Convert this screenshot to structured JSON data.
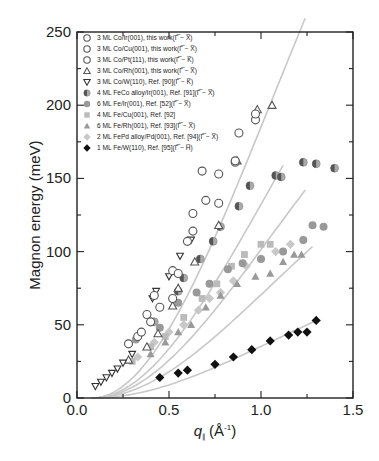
{
  "chart_data": {
    "type": "scatter",
    "title": "",
    "xlabel": "q∥ (Å⁻¹)",
    "xlabel_main": "q",
    "xlabel_sub": "∥",
    "xlabel_unit": "(Å",
    "xlabel_unit_sup": "-1",
    "xlabel_unit_close": ")",
    "ylabel": "Magnon energy (meV)",
    "xlim": [
      0.0,
      1.5
    ],
    "ylim": [
      0,
      250
    ],
    "xticks": [
      0.0,
      0.5,
      1.0,
      1.5
    ],
    "xtick_labels": [
      "0.0",
      "0.5",
      "1.0",
      "1.5"
    ],
    "yticks": [
      0,
      50,
      100,
      150,
      200,
      250
    ],
    "ytick_labels": [
      "0",
      "50",
      "100",
      "150",
      "200",
      "250"
    ],
    "grid": false,
    "legend_position": "upper left",
    "series": [
      {
        "name": "3 ML Co/Ir(001), this work",
        "direction": "(Γ̅ − X̅)",
        "marker": "circle-open",
        "color": "#555555",
        "points": [
          [
            0.28,
            37
          ],
          [
            0.33,
            42
          ],
          [
            0.38,
            57
          ],
          [
            0.42,
            70
          ],
          [
            0.52,
            87
          ],
          [
            0.6,
            107
          ],
          [
            0.68,
            155
          ],
          [
            0.88,
            181
          ],
          [
            0.97,
            190
          ]
        ]
      },
      {
        "name": "3 ML Co/Cu(001), this work",
        "direction": "(Γ̅ − X̅)",
        "marker": "circle-open",
        "color": "#555555",
        "points": [
          [
            0.4,
            52
          ],
          [
            0.52,
            68
          ],
          [
            0.63,
            126
          ],
          [
            0.77,
            153
          ],
          [
            0.86,
            161
          ]
        ]
      },
      {
        "name": "3 ML Co/Pt(111), this work",
        "direction": "(Γ̅ − K̅)",
        "marker": "circle-open",
        "color": "#555555",
        "points": [
          [
            0.35,
            45
          ],
          [
            0.45,
            62
          ],
          [
            0.55,
            85
          ],
          [
            0.63,
            114
          ],
          [
            0.7,
            135
          ],
          [
            0.77,
            133
          ],
          [
            0.86,
            162
          ],
          [
            0.97,
            194
          ]
        ]
      },
      {
        "name": "3 ML Co/Rh(001), this work",
        "direction": "(Γ̅ − X̅)",
        "marker": "triangle-up-open",
        "color": "#555555",
        "points": [
          [
            0.28,
            26
          ],
          [
            0.38,
            35
          ],
          [
            0.44,
            44
          ],
          [
            0.52,
            63
          ],
          [
            0.55,
            75
          ],
          [
            0.64,
            93
          ],
          [
            0.77,
            118
          ],
          [
            0.87,
            162
          ],
          [
            0.98,
            197
          ],
          [
            1.06,
            200
          ]
        ]
      },
      {
        "name": "3 ML Co/W(110), Ref. [90]",
        "direction": "(Γ̅ − K̅)",
        "marker": "triangle-down-open",
        "color": "#333333",
        "points": [
          [
            0.1,
            8
          ],
          [
            0.13,
            11
          ],
          [
            0.16,
            14
          ],
          [
            0.19,
            17
          ],
          [
            0.22,
            20
          ],
          [
            0.25,
            24
          ],
          [
            0.3,
            30
          ],
          [
            0.41,
            68
          ],
          [
            0.43,
            73
          ],
          [
            0.5,
            83
          ],
          [
            0.56,
            97
          ],
          [
            0.62,
            108
          ]
        ]
      },
      {
        "name": "4 ML FeCo alloy/Ir(001), Ref. [91]",
        "direction": "(Γ̅ − X̅)",
        "marker": "half-filled-circle",
        "color": "#888888",
        "points": [
          [
            0.42,
            52
          ],
          [
            0.55,
            73
          ],
          [
            0.58,
            82
          ],
          [
            0.67,
            95
          ],
          [
            0.74,
            107
          ],
          [
            0.78,
            117
          ],
          [
            0.88,
            131
          ],
          [
            0.94,
            145
          ],
          [
            1.08,
            152
          ],
          [
            1.11,
            151
          ],
          [
            1.23,
            161
          ],
          [
            1.3,
            160
          ],
          [
            1.4,
            157
          ]
        ]
      },
      {
        "name": "6 ML Fe/Ir(001), Ref. [52]",
        "direction": "(Γ̅ − X̅)",
        "marker": "circle-filled",
        "color": "#999999",
        "points": [
          [
            0.32,
            40
          ],
          [
            0.45,
            48
          ],
          [
            0.55,
            65
          ],
          [
            0.65,
            72
          ],
          [
            0.72,
            78
          ],
          [
            0.82,
            88
          ],
          [
            0.9,
            92
          ],
          [
            1.0,
            95
          ],
          [
            1.12,
            100
          ],
          [
            1.23,
            108
          ],
          [
            1.28,
            118
          ],
          [
            1.34,
            117
          ]
        ]
      },
      {
        "name": "4 ML Fe/Cu(001), Ref. [92]",
        "direction": "",
        "marker": "square-filled",
        "color": "#bbbbbb",
        "points": [
          [
            0.3,
            25
          ],
          [
            0.4,
            35
          ],
          [
            0.48,
            42
          ],
          [
            0.58,
            55
          ],
          [
            0.68,
            68
          ],
          [
            0.76,
            78
          ],
          [
            0.84,
            90
          ],
          [
            0.91,
            98
          ],
          [
            1.0,
            105
          ],
          [
            1.05,
            105
          ]
        ]
      },
      {
        "name": "6 ML Fe/Rh(001), Ref. [93]",
        "direction": "(Γ̅ − X̅)",
        "marker": "triangle-up-filled",
        "color": "#999999",
        "points": [
          [
            0.4,
            30
          ],
          [
            0.48,
            38
          ],
          [
            0.55,
            45
          ],
          [
            0.62,
            50
          ],
          [
            0.7,
            62
          ],
          [
            0.78,
            70
          ],
          [
            0.87,
            78
          ],
          [
            0.97,
            83
          ],
          [
            1.05,
            85
          ],
          [
            1.12,
            93
          ],
          [
            1.18,
            98
          ],
          [
            1.22,
            98
          ]
        ]
      },
      {
        "name": "2 ML FePd alloy/Pd(001), Ref. [94]",
        "direction": "(Γ̅ − X̅)",
        "marker": "diamond-filled",
        "color": "#c8c8c8",
        "points": [
          [
            0.33,
            28
          ],
          [
            0.42,
            38
          ],
          [
            0.5,
            45
          ],
          [
            0.58,
            50
          ],
          [
            0.66,
            60
          ],
          [
            0.72,
            68
          ],
          [
            0.78,
            72
          ],
          [
            0.85,
            80
          ],
          [
            0.92,
            90
          ],
          [
            1.0,
            95
          ],
          [
            1.08,
            100
          ],
          [
            1.16,
            105
          ]
        ]
      },
      {
        "name": "1 ML Fe/W(110), Ref. [95]",
        "direction": "(Γ̅ − H̅)",
        "marker": "diamond-filled",
        "color": "#111111",
        "points": [
          [
            0.45,
            14
          ],
          [
            0.55,
            17
          ],
          [
            0.6,
            19
          ],
          [
            0.75,
            23
          ],
          [
            0.85,
            28
          ],
          [
            0.95,
            33
          ],
          [
            1.05,
            39
          ],
          [
            1.15,
            43
          ],
          [
            1.2,
            45
          ],
          [
            1.25,
            45
          ],
          [
            1.3,
            53
          ]
        ]
      }
    ],
    "fit_curves": [
      {
        "name": "fit-top",
        "color": "#c8c8c8",
        "a": 210,
        "xmax": 1.17
      },
      {
        "name": "fit-2",
        "color": "#c8c8c8",
        "a": 150,
        "xmax": 1.05
      },
      {
        "name": "fit-3",
        "color": "#c8c8c8",
        "a": 115,
        "xmax": 1.17
      },
      {
        "name": "fit-4",
        "color": "#c8c8c8",
        "a": 80,
        "xmax": 1.2
      },
      {
        "name": "fit-5",
        "color": "#c8c8c8",
        "a": 40,
        "xmax": 1.22
      }
    ]
  }
}
